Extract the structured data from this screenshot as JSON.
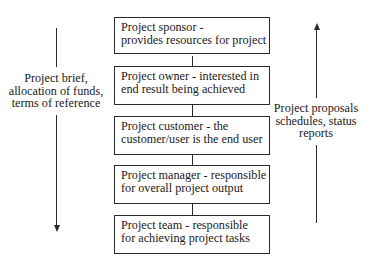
{
  "hierarchy": [
    {
      "line1": "Project sponsor -",
      "line2": "provides resources for project"
    },
    {
      "line1": "Project owner - interested in",
      "line2": "end result being achieved"
    },
    {
      "line1": "Project customer - the",
      "line2": "customer/user is the end user"
    },
    {
      "line1": "Project manager - responsible",
      "line2": "for overall project output"
    },
    {
      "line1": "Project team - responsible",
      "line2": "for achieving project tasks"
    }
  ],
  "downward_flow": {
    "direction": "down",
    "lines": [
      "Project brief,",
      "allocation of funds,",
      "terms of reference"
    ]
  },
  "upward_flow": {
    "direction": "up",
    "lines": [
      "Project proposals",
      "schedules, status",
      "reports"
    ]
  },
  "colors": {
    "line": "#2a2a2a",
    "text": "#1a1a1a",
    "background": "#ffffff"
  }
}
